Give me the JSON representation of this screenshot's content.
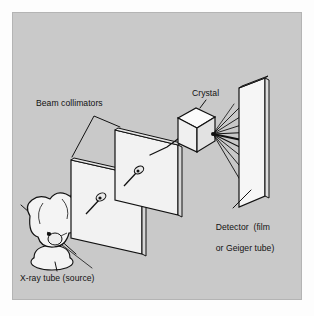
{
  "figure": {
    "panel_background": "#c9c9c9",
    "page_background": "#fdfdfd",
    "line_color": "#111111",
    "face_fill": "#f2f2f2",
    "edge_fill": "#d8d8d8"
  },
  "labels": {
    "beam_collimators": "Beam collimators",
    "crystal": "Crystal",
    "detector_line1": "Detector  (film",
    "detector_line2": "or Geiger tube)",
    "xray_tube": "X-ray tube (source)"
  },
  "components": [
    {
      "name": "x-ray-tube",
      "label": "X-ray tube (source)"
    },
    {
      "name": "collimator-one",
      "label": "Beam collimators"
    },
    {
      "name": "collimator-two",
      "label": "Beam collimators"
    },
    {
      "name": "crystal",
      "label": "Crystal"
    },
    {
      "name": "detector",
      "label": "Detector  (film or Geiger tube)"
    }
  ]
}
